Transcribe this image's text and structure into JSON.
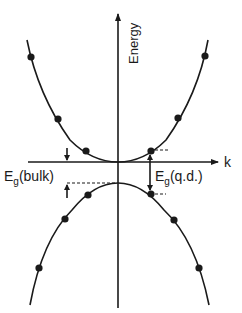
{
  "figure": {
    "y_axis_label": "Energy",
    "x_axis_label": "k",
    "bulk_gap_label": {
      "main": "E",
      "sub": "g",
      "suffix": "(bulk)"
    },
    "qd_gap_label": {
      "main": "E",
      "sub": "g",
      "suffix": "(q.d.)"
    },
    "curves": {
      "conduction_band": "upward parabola (bulk continuous band)",
      "valence_band": "downward parabola (bulk continuous band)"
    },
    "discrete_states": {
      "conduction_band_dots": 6,
      "valence_band_dots": 6
    },
    "colors": {
      "ink": "#1a1a1a",
      "background": "#ffffff"
    }
  }
}
